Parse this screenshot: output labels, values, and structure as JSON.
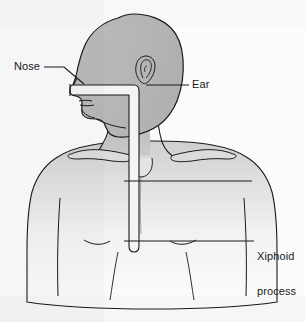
{
  "figure": {
    "background_color": "#fbfbfb"
  },
  "labels": [
    {
      "id": "nose",
      "text": "Nose",
      "x": 14,
      "y": 61,
      "anchor": "left",
      "leader": {
        "from_x": 46,
        "from_y": 67,
        "to_x": 80,
        "to_y": 85
      }
    },
    {
      "id": "ear",
      "text": "Ear",
      "x": 192,
      "y": 79,
      "anchor": "left",
      "leader": {
        "from_x": 188,
        "from_y": 85,
        "to_x": 146,
        "to_y": 85
      }
    },
    {
      "id": "xiphoid",
      "text": "Xiphoid\nprocess",
      "line1": "Xiphoid",
      "line2": "process",
      "x": 257,
      "y": 228,
      "anchor": "left",
      "leader": {
        "from_x": 253,
        "from_y": 241,
        "to_x": 124,
        "to_y": 241
      }
    }
  ],
  "unlabeled_leader": {
    "id": "sternal-notch-line",
    "from_x": 124,
    "from_y": 181,
    "to_x": 252,
    "to_y": 181
  },
  "anatomy": {
    "head_fill": "#b8b8b8",
    "torso_fill_top": "#d5d5d5",
    "torso_fill_bottom": "#fdfdfd",
    "outline_color": "#1a1a1a",
    "tube_fill": "#f4f4f4",
    "tube_outline": "#1a1a1a",
    "parts": [
      "head-profile",
      "ear",
      "nose",
      "lips",
      "chin",
      "jaw",
      "neck",
      "clavicle-left",
      "clavicle-right",
      "shoulder-left",
      "shoulder-right",
      "chest",
      "sternum",
      "nipple-left",
      "nipple-right",
      "arm-crease-left",
      "arm-crease-right"
    ]
  },
  "tube": {
    "name": "nasogastric-tube",
    "segments": [
      {
        "type": "horizontal",
        "from_x": 73,
        "from_y": 88,
        "to_x": 138,
        "to_y": 88
      },
      {
        "type": "vertical",
        "from_x": 138,
        "from_y": 88,
        "to_x": 138,
        "to_y": 250
      }
    ],
    "tip_y": 250,
    "width_px": 7
  }
}
